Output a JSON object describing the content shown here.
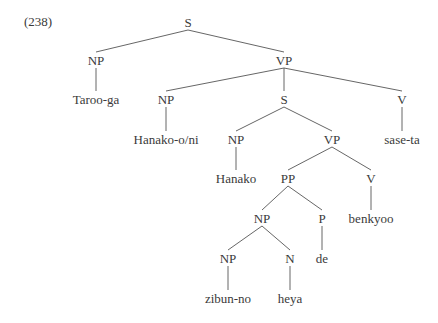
{
  "example_number": "(238)",
  "nodes": [
    {
      "id": "s1",
      "label": "S",
      "x": 188,
      "y": 22
    },
    {
      "id": "np1",
      "label": "NP",
      "x": 96,
      "y": 60
    },
    {
      "id": "vp1",
      "label": "VP",
      "x": 284,
      "y": 60
    },
    {
      "id": "taroo",
      "label": "Taroo-ga",
      "x": 96,
      "y": 99
    },
    {
      "id": "np2",
      "label": "NP",
      "x": 166,
      "y": 99
    },
    {
      "id": "s2",
      "label": "S",
      "x": 284,
      "y": 99
    },
    {
      "id": "v1",
      "label": "V",
      "x": 402,
      "y": 99
    },
    {
      "id": "hanakooni",
      "label": "Hanako-o/ni",
      "x": 166,
      "y": 139
    },
    {
      "id": "np3",
      "label": "NP",
      "x": 236,
      "y": 139
    },
    {
      "id": "vp2",
      "label": "VP",
      "x": 332,
      "y": 139
    },
    {
      "id": "saseta",
      "label": "sase-ta",
      "x": 402,
      "y": 139
    },
    {
      "id": "hanako",
      "label": "Hanako",
      "x": 236,
      "y": 178
    },
    {
      "id": "pp",
      "label": "PP",
      "x": 288,
      "y": 178
    },
    {
      "id": "v2",
      "label": "V",
      "x": 371,
      "y": 178
    },
    {
      "id": "np4",
      "label": "NP",
      "x": 262,
      "y": 218
    },
    {
      "id": "p",
      "label": "P",
      "x": 322,
      "y": 218
    },
    {
      "id": "benkyoo",
      "label": "benkyoo",
      "x": 371,
      "y": 218
    },
    {
      "id": "np5",
      "label": "NP",
      "x": 228,
      "y": 258
    },
    {
      "id": "n",
      "label": "N",
      "x": 290,
      "y": 258
    },
    {
      "id": "de",
      "label": "de",
      "x": 322,
      "y": 258
    },
    {
      "id": "zibunno",
      "label": "zibun-no",
      "x": 228,
      "y": 298
    },
    {
      "id": "heya",
      "label": "heya",
      "x": 290,
      "y": 298
    }
  ],
  "edges": [
    [
      "s1",
      "np1"
    ],
    [
      "s1",
      "vp1"
    ],
    [
      "np1",
      "taroo"
    ],
    [
      "vp1",
      "np2"
    ],
    [
      "vp1",
      "s2"
    ],
    [
      "vp1",
      "v1"
    ],
    [
      "np2",
      "hanakooni"
    ],
    [
      "s2",
      "np3"
    ],
    [
      "s2",
      "vp2"
    ],
    [
      "v1",
      "saseta"
    ],
    [
      "np3",
      "hanako"
    ],
    [
      "vp2",
      "pp"
    ],
    [
      "vp2",
      "v2"
    ],
    [
      "pp",
      "np4"
    ],
    [
      "pp",
      "p"
    ],
    [
      "v2",
      "benkyoo"
    ],
    [
      "np4",
      "np5"
    ],
    [
      "np4",
      "n"
    ],
    [
      "p",
      "de"
    ],
    [
      "np5",
      "zibunno"
    ],
    [
      "n",
      "heya"
    ]
  ],
  "colors": {
    "line": "#555555",
    "text": "#3a3a3a"
  }
}
